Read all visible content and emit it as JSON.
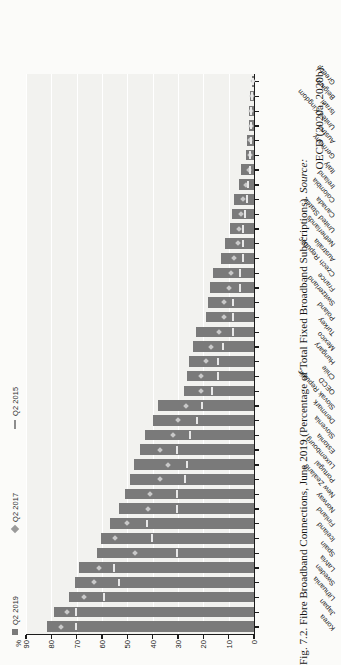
{
  "figure": {
    "number": "Fig. 7.2.",
    "caption_main": "Fibre Broadband Connections, June 2019 (Percentage of Total Fixed Broadband Subscriptions).",
    "source_label": "Source:",
    "source_text": "OECD (2020a, 2020b)."
  },
  "legend": {
    "items": [
      {
        "label": "Q2 2019",
        "marker": "filled-square",
        "color": "#7a7a7a"
      },
      {
        "label": "Q2 2017",
        "marker": "diamond",
        "color": "#9a9a9a"
      },
      {
        "label": "Q2 2015",
        "marker": "line",
        "color": "#8d8d8d"
      }
    ]
  },
  "chart_data": {
    "type": "bar",
    "title": "Fibre Broadband Connections, June 2019 (Percentage of Total Fixed Broadband Subscriptions)",
    "xlabel": "",
    "ylabel": "%",
    "ylim": [
      0,
      90
    ],
    "yticks": [
      "0",
      "10",
      "20",
      "30",
      "40",
      "50",
      "60",
      "70",
      "80",
      "90"
    ],
    "grid": true,
    "legend_position": "top",
    "categories": [
      "Korea",
      "Japan",
      "Lithuania",
      "Sweden",
      "Latvia",
      "Spain",
      "Iceland",
      "Finland",
      "Norway",
      "New Zealand",
      "Portugal",
      "Luxembourg",
      "Estonia",
      "Slovenia",
      "Denmark",
      "Slovak Republic",
      "OECD",
      "Chile",
      "Hungary",
      "Mexico",
      "Turkey",
      "Poland",
      "Switzerland",
      "France",
      "Czech Republic",
      "Australia",
      "Netherlands",
      "United States",
      "Canada",
      "Colombia",
      "Ireland",
      "Italy",
      "Germany",
      "Austria",
      "United Kingdom",
      "Israel",
      "Belgium",
      "Greece"
    ],
    "series": [
      {
        "name": "Q2 2019",
        "values": [
          81.7,
          79.1,
          73.0,
          70.5,
          68.9,
          62.0,
          60.5,
          57.0,
          53.2,
          51.0,
          49.0,
          47.5,
          45.0,
          43.0,
          40.0,
          38.0,
          27.5,
          26.5,
          25.5,
          24.0,
          23.0,
          19.0,
          18.0,
          17.5,
          16.0,
          13.0,
          11.5,
          9.5,
          8.5,
          8.0,
          6.0,
          5.0,
          3.2,
          2.6,
          2.0,
          1.8,
          1.4,
          0.6
        ]
      },
      {
        "name": "Q2 2017",
        "values": [
          76.0,
          74.0,
          67.0,
          63.0,
          61.0,
          47.0,
          55.0,
          50.0,
          42.0,
          41.0,
          37.0,
          34.0,
          37.0,
          32.0,
          30.0,
          27.0,
          21.0,
          21.0,
          19.0,
          17.0,
          14.0,
          12.0,
          12.0,
          10.0,
          9.0,
          8.0,
          6.5,
          6.0,
          5.0,
          4.5,
          3.0,
          2.0,
          1.6,
          1.4,
          1.1,
          1.0,
          0.8,
          0.3
        ]
      },
      {
        "name": "Q2 2015",
        "values": [
          70.0,
          70.0,
          59.0,
          53.0,
          55.0,
          30.0,
          40.0,
          42.0,
          30.0,
          30.0,
          27.0,
          26.0,
          30.0,
          25.0,
          22.0,
          20.0,
          16.0,
          14.0,
          14.0,
          12.0,
          8.0,
          8.0,
          8.0,
          5.0,
          5.0,
          4.0,
          4.0,
          4.0,
          3.0,
          2.5,
          2.0,
          1.2,
          1.0,
          0.9,
          0.7,
          0.6,
          0.5,
          0.2
        ]
      }
    ]
  }
}
